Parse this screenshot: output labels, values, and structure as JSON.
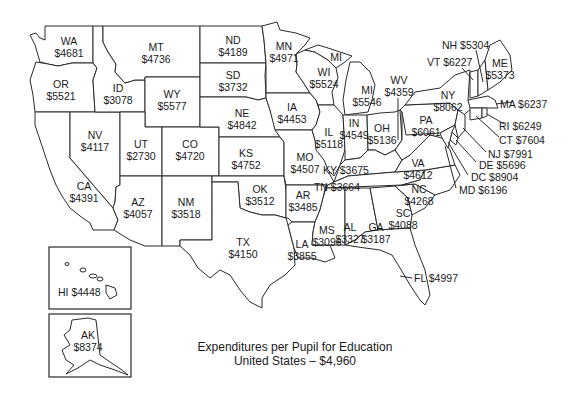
{
  "title": {
    "line1": "Expenditures per Pupil for Education",
    "line2": "United States – $4,960"
  },
  "map_data": {
    "type": "choropleth-labels",
    "metric": "Expenditures per pupil for education (USD)",
    "national_average": "$4,960",
    "states": [
      {
        "code": "WA",
        "value": "$4681"
      },
      {
        "code": "OR",
        "value": "$5521"
      },
      {
        "code": "CA",
        "value": "$4391"
      },
      {
        "code": "NV",
        "value": "$4117"
      },
      {
        "code": "ID",
        "value": "$3078"
      },
      {
        "code": "MT",
        "value": "$4736"
      },
      {
        "code": "WY",
        "value": "$5577"
      },
      {
        "code": "UT",
        "value": "$2730"
      },
      {
        "code": "CO",
        "value": "$4720"
      },
      {
        "code": "AZ",
        "value": "$4057"
      },
      {
        "code": "NM",
        "value": "$3518"
      },
      {
        "code": "ND",
        "value": "$4189"
      },
      {
        "code": "SD",
        "value": "$3732"
      },
      {
        "code": "NE",
        "value": "$4842"
      },
      {
        "code": "KS",
        "value": "$4752"
      },
      {
        "code": "OK",
        "value": "$3512"
      },
      {
        "code": "TX",
        "value": "$4150"
      },
      {
        "code": "MN",
        "value": "$4971"
      },
      {
        "code": "IA",
        "value": "$4453"
      },
      {
        "code": "MO",
        "value": "$4507"
      },
      {
        "code": "AR",
        "value": "$3485"
      },
      {
        "code": "LA",
        "value": "$3855"
      },
      {
        "code": "WI",
        "value": "$5524"
      },
      {
        "code": "IL",
        "value": "$5118"
      },
      {
        "code": "MI",
        "value": "$5546"
      },
      {
        "code": "IN",
        "value": "$4549"
      },
      {
        "code": "OH",
        "value": "$5136"
      },
      {
        "code": "KY",
        "value": "$3675"
      },
      {
        "code": "TN",
        "value": "$3664"
      },
      {
        "code": "MS",
        "value": "$3096"
      },
      {
        "code": "AL",
        "value": "$3327"
      },
      {
        "code": "GA",
        "value": "$3187"
      },
      {
        "code": "FL",
        "value": "$4997"
      },
      {
        "code": "SC",
        "value": "$4088"
      },
      {
        "code": "NC",
        "value": "$4268"
      },
      {
        "code": "VA",
        "value": "$4612"
      },
      {
        "code": "WV",
        "value": "$4359"
      },
      {
        "code": "PA",
        "value": "$6061"
      },
      {
        "code": "NY",
        "value": "$8062"
      },
      {
        "code": "VT",
        "value": "$6227"
      },
      {
        "code": "NH",
        "value": "$5304"
      },
      {
        "code": "ME",
        "value": "$5373"
      },
      {
        "code": "MA",
        "value": "$6237"
      },
      {
        "code": "RI",
        "value": "$6249"
      },
      {
        "code": "CT",
        "value": "$7604"
      },
      {
        "code": "NJ",
        "value": "$7991"
      },
      {
        "code": "DE",
        "value": "$5696"
      },
      {
        "code": "DC",
        "value": "$8904"
      },
      {
        "code": "MD",
        "value": "$6196"
      },
      {
        "code": "HI",
        "value": "$4448"
      },
      {
        "code": "AK",
        "value": "$8374"
      }
    ]
  },
  "labels": {
    "WA": {
      "code": "WA",
      "value": "$4681"
    },
    "OR": {
      "code": "OR",
      "value": "$5521"
    },
    "CA": {
      "code": "CA",
      "value": "$4391"
    },
    "NV": {
      "code": "NV",
      "value": "$4117"
    },
    "ID": {
      "code": "ID",
      "value": "$3078"
    },
    "MT": {
      "code": "MT",
      "value": "$4736"
    },
    "WY": {
      "code": "WY",
      "value": "$5577"
    },
    "UT": {
      "code": "UT",
      "value": "$2730"
    },
    "CO": {
      "code": "CO",
      "value": "$4720"
    },
    "AZ": {
      "code": "AZ",
      "value": "$4057"
    },
    "NM": {
      "code": "NM",
      "value": "$3518"
    },
    "ND": {
      "code": "ND",
      "value": "$4189"
    },
    "SD": {
      "code": "SD",
      "value": "$3732"
    },
    "NE": {
      "code": "NE",
      "value": "$4842"
    },
    "KS": {
      "code": "KS",
      "value": "$4752"
    },
    "OK": {
      "code": "OK",
      "value": "$3512"
    },
    "TX": {
      "code": "TX",
      "value": "$4150"
    },
    "MN": {
      "code": "MN",
      "value": "$4971"
    },
    "IA": {
      "code": "IA",
      "value": "$4453"
    },
    "MO": {
      "code": "MO",
      "value": "$4507"
    },
    "AR": {
      "code": "AR",
      "value": "$3485"
    },
    "LA": {
      "code": "LA",
      "value": "$3855"
    },
    "WI": {
      "code": "WI",
      "value": "$5524"
    },
    "IL": {
      "code": "IL",
      "value": "$5118"
    },
    "MI_UP": {
      "code": "MI"
    },
    "MI": {
      "code": "MI",
      "value": "$5546"
    },
    "IN": {
      "code": "IN",
      "value": "$4549"
    },
    "OH": {
      "code": "OH",
      "value": "$5136"
    },
    "KY": {
      "text": "KY $3675"
    },
    "TN": {
      "text": "TN $3664"
    },
    "MS": {
      "code": "MS",
      "value": "$3096"
    },
    "AL": {
      "code": "AL",
      "value": "$3327"
    },
    "GA": {
      "code": "GA",
      "value": "$3187"
    },
    "FL": {
      "text": "FL $4997"
    },
    "SC": {
      "code": "SC",
      "value": "$4088"
    },
    "NC": {
      "code": "NC",
      "value": "$4268"
    },
    "VA": {
      "code": "VA",
      "value": "$4612"
    },
    "WV": {
      "code": "WV",
      "value": "$4359"
    },
    "PA": {
      "code": "PA",
      "value": "$6061"
    },
    "NY": {
      "code": "NY",
      "value": "$8062"
    },
    "VT": {
      "text": "VT $6227"
    },
    "NH": {
      "text": "NH $5304"
    },
    "ME": {
      "code": "ME",
      "value": "$5373"
    },
    "MA": {
      "text": "MA $6237"
    },
    "RI": {
      "text": "RI $6249"
    },
    "CT": {
      "text": "CT $7604"
    },
    "NJ": {
      "text": "NJ $7991"
    },
    "DE": {
      "text": "DE $5696"
    },
    "DC": {
      "text": "DC $8904"
    },
    "MD": {
      "text": "MD $6196"
    },
    "HI": {
      "text": "HI $4448"
    },
    "AK": {
      "code": "AK",
      "value": "$8374"
    }
  }
}
